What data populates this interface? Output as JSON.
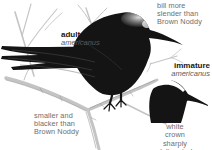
{
  "figure": {
    "labels": {
      "adult": {
        "title": "adult",
        "subspecies": "americanus"
      },
      "immature": {
        "title": "immature",
        "subspecies": "americanus"
      }
    },
    "annotations": {
      "bill": "bill more\nslender than\nBrown Noddy",
      "size": "smaller and\nblacker than\nBrown Noddy",
      "crown": "white crown\nsharply delineated\nat rear"
    },
    "colors": {
      "background": "#ffffff",
      "ink": "#141414",
      "crown_white": "#ffffff",
      "branch": "#c4c4c4",
      "branch_line": "#949494",
      "annotation_text": "#6e6e6e",
      "label_text": "#161616",
      "subspecies_text": "#5a5a5a"
    }
  }
}
